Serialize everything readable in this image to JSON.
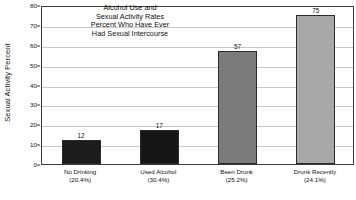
{
  "chart_data": {
    "type": "bar",
    "title_lines": [
      "Alcohol Use and",
      "Sexual Activity Rates",
      "Percent Who Have Ever",
      "Had Sexual Intercourse"
    ],
    "xlabel": "",
    "ylabel": "Sexual Activity Percent",
    "ylim": [
      0,
      80
    ],
    "ytick_values": [
      0,
      10,
      20,
      30,
      40,
      50,
      60,
      70,
      80
    ],
    "ytick_labels": [
      "0",
      "10",
      "20",
      "30",
      "40",
      "50",
      "60",
      "70",
      "80"
    ],
    "grid": true,
    "legend": "none",
    "categories": [
      "No Drinking",
      "Used Alcohol",
      "Been Drunk",
      "Drunk Recently"
    ],
    "category_sublabels": [
      "(20.4%)",
      "(30.4%)",
      "(25.2%)",
      "(24.1%)"
    ],
    "values": [
      12,
      17,
      57,
      75
    ],
    "value_labels": [
      "12",
      "17",
      "57",
      "75"
    ],
    "bar_colors": [
      "#1c1c1c",
      "#161616",
      "#7b7b7b",
      "#a8a8a8"
    ],
    "bar_edge_color": "#2b2b2b",
    "axis_color": "#3b3b3b",
    "gridline_color": "#c9c9c9",
    "background_color": "#ffffff"
  }
}
